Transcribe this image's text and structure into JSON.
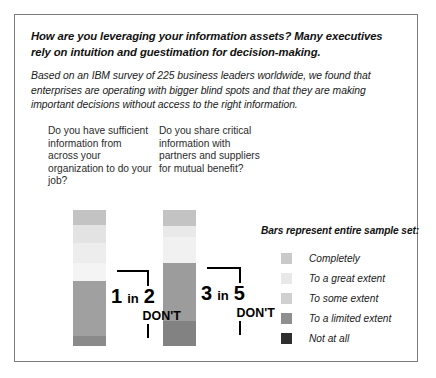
{
  "headline": "How are you leveraging your information assets? Many executives rely on intuition and guestimation for decision-making.",
  "subhead": "Based on an IBM survey of 225 business leaders worldwide, we found that enterprises are operating with bigger blind spots and that they are making important decisions without access to the right information.",
  "questions": [
    {
      "text": "Do you have sufficient information from across your organization to do your job?"
    },
    {
      "text": "Do you share critical information with partners and suppliers for mutual benefit?"
    }
  ],
  "callouts": [
    {
      "number": "1",
      "in": "in",
      "number2": "2",
      "dont": "DON'T"
    },
    {
      "number": "3",
      "in": "in",
      "number2": "5",
      "dont": "DON'T"
    }
  ],
  "legend": {
    "title": "Bars represent entire sample set:",
    "items": [
      {
        "label": "Completely",
        "color": "#c9c9c9"
      },
      {
        "label": "To a great extent",
        "color": "#e8e8e8"
      },
      {
        "label": "To some extent",
        "color": "#d0d0d0"
      },
      {
        "label": "To a limited extent",
        "color": "#8f8f8f"
      },
      {
        "label": "Not at all",
        "color": "#2e2e2e"
      }
    ]
  },
  "chart_data": {
    "type": "bar",
    "title": "How are you leveraging your information assets?",
    "orientation": "vertical-stacked",
    "categories": [
      "Do you have sufficient information from across your organization to do your job?",
      "Do you share critical information with partners and suppliers for mutual benefit?"
    ],
    "series": [
      {
        "name": "Completely",
        "color": "#c9c9c9",
        "values": [
          11,
          11
        ]
      },
      {
        "name": "To a great extent",
        "color": "#e8e8e8",
        "values": [
          39,
          26
        ]
      },
      {
        "name": "To some extent",
        "color": "#d0d0d0",
        "values": [
          0,
          0
        ]
      },
      {
        "name": "To a limited extent",
        "color": "#9a9a9a",
        "values": [
          43,
          45
        ]
      },
      {
        "name": "Not at all",
        "color": "#7d7d7d",
        "values": [
          7,
          18
        ]
      }
    ],
    "annotations": [
      {
        "text": "1 in 2 DON'T",
        "category_index": 0
      },
      {
        "text": "3 in 5 DON'T",
        "category_index": 1
      }
    ],
    "legend_position": "right",
    "grid": false,
    "ylim": [
      0,
      100
    ],
    "xlabel": "",
    "ylabel": ""
  },
  "bars": [
    {
      "segments": [
        {
          "name": "Completely",
          "color": "#c3c3c3",
          "pct": 11
        },
        {
          "name": "To a great extent",
          "color": "#e3e3e3",
          "pct": 13
        },
        {
          "name": "To some extent",
          "color": "#ededed",
          "pct": 15
        },
        {
          "name": "To a limited extent",
          "color": "#f4f4f4",
          "pct": 13
        },
        {
          "name": "Not at all",
          "color": "#a0a0a0",
          "pct": 41
        },
        {
          "name": "Base",
          "color": "#8a8a8a",
          "pct": 7
        }
      ]
    },
    {
      "segments": [
        {
          "name": "Completely",
          "color": "#c3c3c3",
          "pct": 12
        },
        {
          "name": "To a great extent",
          "color": "#e9e9e9",
          "pct": 8
        },
        {
          "name": "To some extent",
          "color": "#f1f1f1",
          "pct": 19
        },
        {
          "name": "To a limited extent",
          "color": "#9c9c9c",
          "pct": 43
        },
        {
          "name": "Not at all",
          "color": "#828282",
          "pct": 18
        }
      ]
    }
  ]
}
